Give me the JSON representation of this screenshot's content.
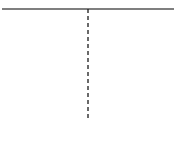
{
  "diagram": {
    "type": "profile-shape",
    "colors": {
      "stroke": "#1a1a1a",
      "top_edge": "#555555",
      "background": "#ffffff"
    },
    "elements": {
      "top_edge": {
        "x1": 2,
        "y1": 9,
        "x2": 174,
        "y2": 9
      },
      "left_curve": "M2,9 C4,40 20,60 50,72 C75,82 86,100 88,132",
      "right_curve": "M174,9 C172,40 156,60 126,72 C101,82 90,100 88,132",
      "centerline": {
        "x": 88,
        "y1": 9,
        "y2": 120,
        "dash": "4,3"
      }
    }
  }
}
